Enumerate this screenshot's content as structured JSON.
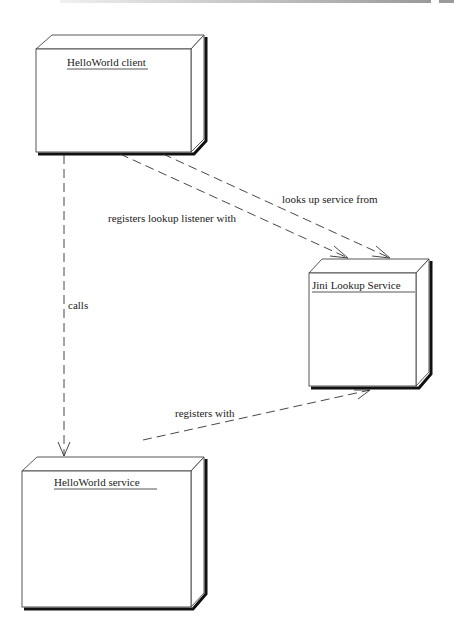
{
  "diagram": {
    "type": "UML deployment diagram",
    "nodes": [
      {
        "id": "client",
        "label": "HelloWorld client"
      },
      {
        "id": "lookup",
        "label": "Jini Lookup Service"
      },
      {
        "id": "service",
        "label": "HelloWorld service"
      }
    ],
    "edges": [
      {
        "from": "client",
        "to": "lookup",
        "label": "looks up service from"
      },
      {
        "from": "client",
        "to": "lookup",
        "label": "registers lookup listener with"
      },
      {
        "from": "client",
        "to": "service",
        "label": "calls"
      },
      {
        "from": "service",
        "to": "lookup",
        "label": "registers with"
      }
    ]
  }
}
